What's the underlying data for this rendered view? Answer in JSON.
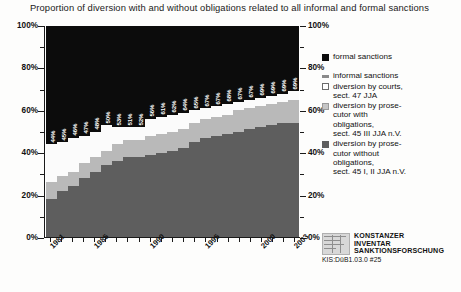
{
  "chart_data": {
    "type": "bar",
    "subtype": "100-percent-stacked-column",
    "title": "Proportion of diversion with and without obligations related to all informal and formal sanctions",
    "xlabel": "",
    "ylabel": "",
    "ylim": [
      0,
      100
    ],
    "ytick_labels_left": [
      "100%",
      "80%",
      "60%",
      "40%",
      "20%",
      "0%"
    ],
    "ytick_labels_right": [
      "100%",
      "80%",
      "60%",
      "40%",
      "20%",
      "0%"
    ],
    "ytick_values": [
      100,
      80,
      60,
      40,
      20,
      0
    ],
    "grid": false,
    "legend_position": "right",
    "categories": [
      "1981",
      "1982",
      "1983",
      "1984",
      "1985",
      "1986",
      "1987",
      "1988",
      "1989",
      "1990",
      "1991",
      "1992",
      "1993",
      "1994",
      "1995",
      "1996",
      "1997",
      "1998",
      "1999",
      "2000",
      "2001",
      "2002",
      "2003"
    ],
    "xtick_labels_shown": [
      "1981",
      "1985",
      "1990",
      "1995",
      "2000",
      "2003"
    ],
    "series": [
      {
        "name": "diversion by prosecutor without obligations, sect. 45 I, II JJA n.V.",
        "key": "without",
        "color": "#5e5e5e",
        "values": [
          18,
          22,
          24,
          28,
          31,
          34,
          36,
          38,
          38,
          39,
          40,
          41,
          42,
          45,
          47,
          48,
          49,
          50,
          51,
          52,
          53,
          54,
          54
        ]
      },
      {
        "name": "diversion by prosecutor with obligations, sect. 45 III JJA n.V.",
        "key": "with",
        "color": "#b9b9b9",
        "values": [
          8,
          7,
          7,
          7,
          7,
          7,
          8,
          8,
          8,
          9,
          9,
          9,
          9,
          9,
          9,
          9,
          9,
          10,
          10,
          10,
          10,
          10,
          11
        ]
      },
      {
        "name": "diversion by courts, sect. 47 JJA",
        "key": "courts",
        "color": "#fbfbfb",
        "values": [
          18,
          16,
          16,
          13,
          12,
          12,
          8,
          6,
          6,
          8,
          8,
          8,
          8,
          6,
          5,
          5,
          5,
          4,
          4,
          4,
          4,
          4,
          4
        ]
      },
      {
        "name": "formal sanctions",
        "key": "formal",
        "color": "#0c0c0c",
        "values": [
          56,
          55,
          53,
          52,
          50,
          47,
          48,
          48,
          48,
          44,
          43,
          42,
          41,
          40,
          39,
          38,
          37,
          36,
          35,
          34,
          33,
          32,
          31
        ]
      }
    ],
    "data_labels": [
      "44%",
      "45%",
      "46%",
      "47%",
      "48%",
      "50%",
      "53%",
      "51%",
      "52%",
      "56%",
      "61%",
      "62%",
      "64%",
      "65%",
      "67%",
      "67%",
      "68%",
      "67%",
      "67%",
      "69%",
      "69%",
      "69%",
      "69%"
    ],
    "data_labels_note": "total share of informal sanctions (diversion) per year"
  },
  "legend": {
    "items": [
      {
        "label": "formal sanctions",
        "swatch": "formal"
      },
      {
        "label": "informal sanctions",
        "swatch": "informal"
      },
      {
        "label": "diversion by courts,\nsect. 47 JJA",
        "swatch": "courts"
      },
      {
        "label": "diversion by prose-\ncutor with\nobligations,\nsect. 45 III JJA n.V.",
        "swatch": "with"
      },
      {
        "label": "diversion by prose-\ncutor without\nobligations,\nsect. 45 I, II JJA n.V.",
        "swatch": "without"
      }
    ]
  },
  "source_mark": {
    "line1": "KONSTANZER",
    "line2": "INVENTAR",
    "line3": "SANKTIONSFORSCHUNG",
    "code": "KIS:DüB1.03.0 #25"
  }
}
